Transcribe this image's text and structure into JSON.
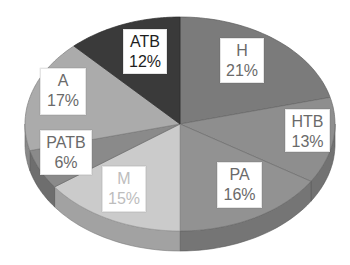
{
  "chart_data": {
    "type": "pie",
    "style": "3d-tilted",
    "title": "",
    "start_angle_deg": 0,
    "direction": "clockwise",
    "slices": [
      {
        "label": "H",
        "value": 21,
        "display": "21%",
        "color": "#7b7b7b",
        "text_color": "#6a6a6a"
      },
      {
        "label": "HTB",
        "value": 13,
        "display": "13%",
        "color": "#8e8e8e",
        "text_color": "#6a6a6a"
      },
      {
        "label": "PA",
        "value": 16,
        "display": "16%",
        "color": "#929292",
        "text_color": "#6a6a6a"
      },
      {
        "label": "M",
        "value": 15,
        "display": "15%",
        "color": "#cbcbcb",
        "text_color": "#bdbdbd"
      },
      {
        "label": "PATB",
        "value": 6,
        "display": "6%",
        "color": "#8a8a8a",
        "text_color": "#6a6a6a"
      },
      {
        "label": "A",
        "value": 17,
        "display": "17%",
        "color": "#ababab",
        "text_color": "#6a6a6a"
      },
      {
        "label": "ATB",
        "value": 12,
        "display": "12%",
        "color": "#3a3a3a",
        "text_color": "#1e1e1e"
      }
    ],
    "legend": "none",
    "data_labels": "category and percentage in white boxes"
  },
  "labels": [
    {
      "name": "H",
      "pct": "21%",
      "left": 220,
      "top": 38,
      "w": 44,
      "h": 45
    },
    {
      "name": "HTB",
      "pct": "13%",
      "left": 285,
      "top": 109,
      "w": 45,
      "h": 43
    },
    {
      "name": "PA",
      "pct": "16%",
      "left": 217,
      "top": 162,
      "w": 45,
      "h": 46
    },
    {
      "name": "M",
      "pct": "15%",
      "left": 102,
      "top": 166,
      "w": 44,
      "h": 46
    },
    {
      "name": "PATB",
      "pct": "6%",
      "left": 40,
      "top": 130,
      "w": 52,
      "h": 45
    },
    {
      "name": "A",
      "pct": "17%",
      "left": 40,
      "top": 68,
      "w": 46,
      "h": 47
    },
    {
      "name": "ATB",
      "pct": "12%",
      "left": 123,
      "top": 29,
      "w": 44,
      "h": 45
    }
  ]
}
